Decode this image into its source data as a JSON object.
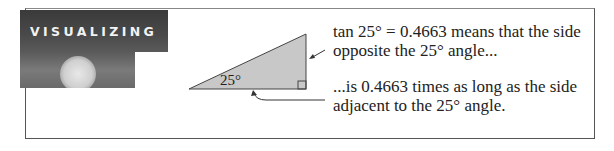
{
  "header": {
    "title": "VISUALIZING"
  },
  "figure": {
    "angle_label": "25°",
    "triangle_fill": "#c8c8c8",
    "stroke": "#444444"
  },
  "captions": {
    "top_line1": "tan 25° = 0.4663 means that the side",
    "top_line2": "opposite the 25° angle...",
    "bottom_line1": "...is 0.4663 times as long as the side",
    "bottom_line2": "adjacent to the 25° angle."
  }
}
